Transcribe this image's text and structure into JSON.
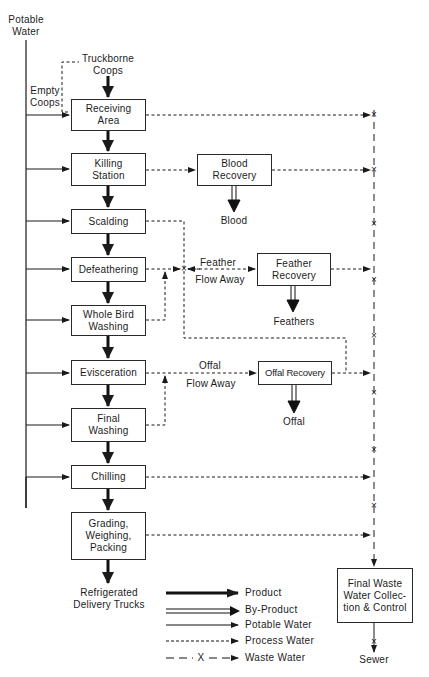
{
  "diagram": {
    "type": "process flow diagram",
    "sources": {
      "potable_water": "Potable\nWater",
      "truckborne_coops": "Truckborne\nCoops",
      "empty_coops": "Empty\nCoops"
    },
    "process_steps": [
      {
        "id": "receiving",
        "label": "Receiving\nArea"
      },
      {
        "id": "killing",
        "label": "Killing\nStation"
      },
      {
        "id": "scalding",
        "label": "Scalding"
      },
      {
        "id": "defeathering",
        "label": "Defeathering"
      },
      {
        "id": "whole_bird_washing",
        "label": "Whole Bird\nWashing"
      },
      {
        "id": "evisceration",
        "label": "Evisceration"
      },
      {
        "id": "final_washing",
        "label": "Final\nWashing"
      },
      {
        "id": "chilling",
        "label": "Chilling"
      },
      {
        "id": "grading",
        "label": "Grading,\nWeighing,\nPacking"
      }
    ],
    "recovery_units": [
      {
        "id": "blood_recovery",
        "label": "Blood\nRecovery",
        "output": "Blood"
      },
      {
        "id": "feather_recovery",
        "label": "Feather\nRecovery",
        "output": "Feathers"
      },
      {
        "id": "offal_recovery",
        "label": "Offal Recovery",
        "output": "Offal"
      }
    ],
    "flow_labels": {
      "feather_flow_top": "Feather",
      "feather_flow_bottom": "Flow Away",
      "offal_flow_top": "Offal",
      "offal_flow_bottom": "Flow Away"
    },
    "destinations": {
      "delivery": "Refrigerated\nDelivery Trucks",
      "final_waste": "Final Waste\nWater Collec-\ntion & Control",
      "sewer": "Sewer"
    },
    "waste_marker": "×",
    "legend": [
      {
        "style": "thick-solid",
        "label": "Product"
      },
      {
        "style": "double-line",
        "label": "By-Product"
      },
      {
        "style": "thin-solid",
        "label": "Potable Water"
      },
      {
        "style": "short-dash",
        "label": "Process Water"
      },
      {
        "style": "long-dash-x",
        "label": "Waste Water",
        "marker": "X"
      }
    ],
    "caption": "FIG. — Flow diagram of poultry processing plant"
  }
}
